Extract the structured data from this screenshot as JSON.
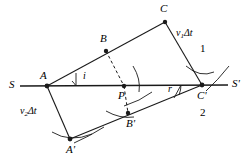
{
  "figure": {
    "type": "huygens-refraction-construction",
    "colors": {
      "stroke": "#1a1a1a",
      "background": "#ffffff"
    },
    "interface_line": {
      "left_label": "S",
      "right_label": "S'"
    },
    "points": [
      {
        "id": "A",
        "label": "A",
        "x": 47,
        "y": 86
      },
      {
        "id": "B",
        "label": "B",
        "x": 106,
        "y": 51
      },
      {
        "id": "C",
        "label": "C",
        "x": 165,
        "y": 22
      },
      {
        "id": "P",
        "label": "P",
        "x": 124,
        "y": 86
      },
      {
        "id": "Cp",
        "label": "C'",
        "x": 202,
        "y": 85
      },
      {
        "id": "Bp",
        "label": "B'",
        "x": 128,
        "y": 113
      },
      {
        "id": "Ap",
        "label": "A'",
        "x": 70,
        "y": 139
      }
    ],
    "angles": [
      {
        "id": "incidence",
        "label": "i",
        "vertex": "A",
        "x": 80,
        "y": 76
      },
      {
        "id": "refraction",
        "label": "r",
        "vertex": "Cp",
        "x": 172,
        "y": 90
      }
    ],
    "vectors": [
      {
        "id": "v1dt",
        "symbol": "v",
        "subscript": "1",
        "suffix": "Δt",
        "x": 182,
        "y": 35
      },
      {
        "id": "v2dt",
        "symbol": "v",
        "subscript": "2",
        "suffix": "Δt",
        "x": 27,
        "y": 113
      }
    ],
    "regions": [
      {
        "id": "medium-1",
        "label": "1",
        "x": 203,
        "y": 49
      },
      {
        "id": "medium-2",
        "label": "2",
        "x": 203,
        "y": 113
      }
    ]
  }
}
